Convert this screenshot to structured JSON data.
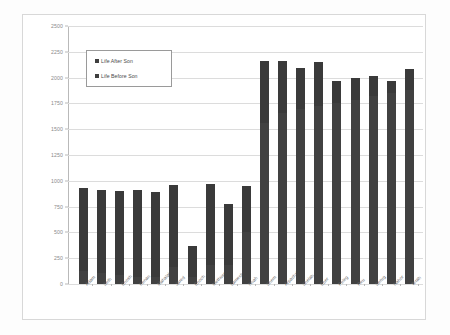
{
  "chart_data": {
    "type": "bar",
    "title": "",
    "xlabel": "",
    "ylabel": "",
    "ylim": [
      0,
      2500
    ],
    "ytick_step": 250,
    "yticks": [
      "0",
      "250",
      "500",
      "750",
      "1000",
      "1250",
      "1500",
      "1750",
      "2000",
      "2250",
      "2500"
    ],
    "grid": true,
    "stacked": true,
    "legend_position": "inside-top-left",
    "legend": [
      "Life After Son",
      "Life Before Son"
    ],
    "categories": [
      "Adam",
      "Seth",
      "Enosh",
      "Kenan",
      "Mahalalel",
      "Jared",
      "Enoch",
      "Methuselah",
      "Lamech",
      "Noah",
      "Shem",
      "Arpachshad",
      "Shelah",
      "Eber",
      "Peleg",
      "Reu",
      "Serug",
      "Nahor",
      "Terah"
    ],
    "series": [
      {
        "name": "Life Before Son",
        "values": [
          130,
          105,
          90,
          70,
          65,
          162,
          65,
          187,
          182,
          500,
          1558,
          1658,
          1693,
          1723,
          1757,
          1787,
          1819,
          1849,
          1878
        ]
      },
      {
        "name": "Life After Son",
        "values": [
          800,
          807,
          815,
          840,
          830,
          800,
          300,
          782,
          595,
          450,
          600,
          503,
          403,
          430,
          209,
          207,
          200,
          119,
          205
        ]
      }
    ],
    "totals": [
      930,
      912,
      905,
      910,
      895,
      962,
      365,
      969,
      777,
      950,
      2158,
      2161,
      2096,
      2153,
      1966,
      1994,
      2019,
      1968,
      2083
    ],
    "colors": {
      "life_after_son": "#3a3a3a",
      "life_before_son": "#414141",
      "gridline": "#dcdcdc",
      "axis": "#b9b9b9",
      "tick_text": "#8a8a8a",
      "category_text": "#6d6d6d",
      "legend_border": "#9a9a9a",
      "frame_border": "#d8d8d8",
      "background": "#ffffff"
    }
  }
}
